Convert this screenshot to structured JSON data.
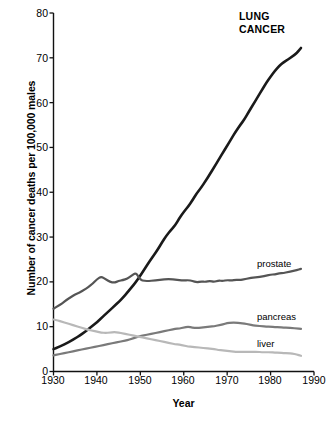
{
  "chart_data": {
    "type": "line",
    "title": "",
    "xlabel": "Year",
    "ylabel": "Number of cancer deaths per 100,000 males",
    "xlim": [
      1930,
      1990
    ],
    "ylim": [
      0,
      80
    ],
    "xticks": [
      "1930",
      "1940",
      "1950",
      "1960",
      "1970",
      "1980",
      "1990"
    ],
    "yticks": [
      "0",
      "10",
      "20",
      "30",
      "40",
      "50",
      "60",
      "70",
      "80"
    ],
    "grid": false,
    "legend_position": "inline-right",
    "annotations": [
      {
        "text": "LUNG CANCER",
        "series": "Lung cancer",
        "style": "bold-uppercase-two-line"
      }
    ],
    "series": [
      {
        "name": "Lung cancer",
        "label": "LUNG CANCER",
        "color": "#1a1a1a",
        "linewidth": 2.6,
        "x": [
          1930,
          1931,
          1932,
          1933,
          1934,
          1935,
          1936,
          1937,
          1938,
          1939,
          1940,
          1941,
          1942,
          1943,
          1944,
          1945,
          1946,
          1947,
          1948,
          1949,
          1950,
          1951,
          1952,
          1953,
          1954,
          1955,
          1956,
          1957,
          1958,
          1959,
          1960,
          1961,
          1962,
          1963,
          1964,
          1965,
          1966,
          1967,
          1968,
          1969,
          1970,
          1971,
          1972,
          1973,
          1974,
          1975,
          1976,
          1977,
          1978,
          1979,
          1980,
          1981,
          1982,
          1983,
          1984,
          1985,
          1986,
          1987
        ],
        "values": [
          5.0,
          5.4,
          5.8,
          6.3,
          6.8,
          7.4,
          8.0,
          8.7,
          9.4,
          10.2,
          11.0,
          11.9,
          12.8,
          13.7,
          14.6,
          15.5,
          16.5,
          17.6,
          18.8,
          20.0,
          21.4,
          22.9,
          24.4,
          25.8,
          27.2,
          28.8,
          30.3,
          31.5,
          32.6,
          34.2,
          35.6,
          36.8,
          38.2,
          39.8,
          41.0,
          42.5,
          44.0,
          45.6,
          47.2,
          48.8,
          50.4,
          52.0,
          53.6,
          55.0,
          56.3,
          58.0,
          59.6,
          61.2,
          62.8,
          64.4,
          65.8,
          67.1,
          68.2,
          69.0,
          69.6,
          70.3,
          71.0,
          72.2
        ]
      },
      {
        "name": "Prostate",
        "label": "prostate",
        "color": "#555555",
        "linewidth": 2.2,
        "x": [
          1930,
          1931,
          1932,
          1933,
          1934,
          1935,
          1936,
          1937,
          1938,
          1939,
          1940,
          1941,
          1942,
          1943,
          1944,
          1945,
          1946,
          1947,
          1948,
          1949,
          1950,
          1951,
          1952,
          1953,
          1954,
          1955,
          1956,
          1957,
          1958,
          1959,
          1960,
          1961,
          1962,
          1963,
          1964,
          1965,
          1966,
          1967,
          1968,
          1969,
          1970,
          1971,
          1972,
          1973,
          1974,
          1975,
          1976,
          1977,
          1978,
          1979,
          1980,
          1981,
          1982,
          1983,
          1984,
          1985,
          1986,
          1987
        ],
        "values": [
          14.0,
          14.6,
          15.2,
          16.0,
          16.6,
          17.2,
          17.6,
          18.2,
          18.8,
          19.6,
          20.6,
          21.2,
          20.6,
          20.0,
          19.8,
          20.2,
          20.4,
          20.7,
          21.4,
          22.1,
          20.4,
          20.2,
          20.2,
          20.3,
          20.4,
          20.5,
          20.6,
          20.6,
          20.5,
          20.4,
          20.3,
          20.4,
          20.2,
          19.9,
          20.1,
          20.0,
          20.2,
          20.0,
          20.3,
          20.2,
          20.4,
          20.3,
          20.5,
          20.4,
          20.6,
          20.8,
          21.0,
          21.0,
          21.2,
          21.4,
          21.6,
          21.7,
          21.9,
          22.0,
          22.2,
          22.4,
          22.6,
          22.9
        ]
      },
      {
        "name": "Pancreas",
        "label": "pancreas",
        "color": "#7a7a7a",
        "linewidth": 2.2,
        "x": [
          1930,
          1931,
          1932,
          1933,
          1934,
          1935,
          1936,
          1937,
          1938,
          1939,
          1940,
          1941,
          1942,
          1943,
          1944,
          1945,
          1946,
          1947,
          1948,
          1949,
          1950,
          1951,
          1952,
          1953,
          1954,
          1955,
          1956,
          1957,
          1958,
          1959,
          1960,
          1961,
          1962,
          1963,
          1964,
          1965,
          1966,
          1967,
          1968,
          1969,
          1970,
          1971,
          1972,
          1973,
          1974,
          1975,
          1976,
          1977,
          1978,
          1979,
          1980,
          1981,
          1982,
          1983,
          1984,
          1985,
          1986,
          1987
        ],
        "values": [
          3.6,
          3.8,
          4.0,
          4.2,
          4.4,
          4.6,
          4.8,
          5.0,
          5.2,
          5.4,
          5.6,
          5.8,
          6.0,
          6.2,
          6.4,
          6.6,
          6.8,
          7.0,
          7.3,
          7.6,
          7.9,
          8.1,
          8.3,
          8.5,
          8.7,
          8.9,
          9.1,
          9.3,
          9.5,
          9.6,
          9.8,
          10.0,
          9.8,
          9.7,
          9.8,
          9.9,
          10.0,
          10.1,
          10.3,
          10.5,
          10.8,
          10.9,
          10.9,
          10.8,
          10.7,
          10.5,
          10.3,
          10.2,
          10.1,
          10.0,
          10.0,
          9.9,
          9.9,
          9.8,
          9.8,
          9.7,
          9.6,
          9.5
        ]
      },
      {
        "name": "Liver",
        "label": "liver",
        "color": "#b8b8b8",
        "linewidth": 2.2,
        "x": [
          1930,
          1931,
          1932,
          1933,
          1934,
          1935,
          1936,
          1937,
          1938,
          1939,
          1940,
          1941,
          1942,
          1943,
          1944,
          1945,
          1946,
          1947,
          1948,
          1949,
          1950,
          1951,
          1952,
          1953,
          1954,
          1955,
          1956,
          1957,
          1958,
          1959,
          1960,
          1961,
          1962,
          1963,
          1964,
          1965,
          1966,
          1967,
          1968,
          1969,
          1970,
          1971,
          1972,
          1973,
          1974,
          1975,
          1976,
          1977,
          1978,
          1979,
          1980,
          1981,
          1982,
          1983,
          1984,
          1985,
          1986,
          1987
        ],
        "values": [
          11.6,
          11.4,
          11.1,
          10.8,
          10.5,
          10.2,
          9.9,
          9.6,
          9.3,
          9.1,
          8.9,
          8.7,
          8.6,
          8.7,
          8.8,
          8.7,
          8.5,
          8.3,
          8.1,
          7.9,
          7.7,
          7.5,
          7.3,
          7.1,
          6.9,
          6.7,
          6.5,
          6.3,
          6.1,
          6.0,
          5.8,
          5.6,
          5.5,
          5.4,
          5.3,
          5.2,
          5.1,
          5.0,
          4.8,
          4.7,
          4.6,
          4.5,
          4.4,
          4.4,
          4.4,
          4.4,
          4.4,
          4.4,
          4.3,
          4.3,
          4.3,
          4.2,
          4.2,
          4.1,
          4.1,
          4.0,
          3.8,
          3.5
        ]
      }
    ]
  },
  "labels": {
    "lung_line1": "LUNG",
    "lung_line2": "CANCER",
    "prostate": "prostate",
    "pancreas": "pancreas",
    "liver": "liver"
  }
}
